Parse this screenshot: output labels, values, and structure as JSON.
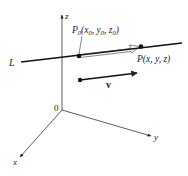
{
  "figure": {
    "type": "3d-line-vector-diagram",
    "colors": {
      "ink": "#222222",
      "background": "#ffffff"
    },
    "axes": {
      "origin_label": "0",
      "x_label": "x",
      "y_label": "y",
      "z_label": "z"
    },
    "line": {
      "label": "L"
    },
    "points": {
      "p0": {
        "name": "P",
        "sub": "0",
        "coords_text": "(x",
        "x_sub": "0",
        "y_text": ", y",
        "y_sub": "0",
        "z_text": ", z",
        "z_sub": "0",
        "close": ")"
      },
      "p": {
        "label": "P(x, y, z)"
      }
    },
    "vector": {
      "label": "v"
    }
  }
}
